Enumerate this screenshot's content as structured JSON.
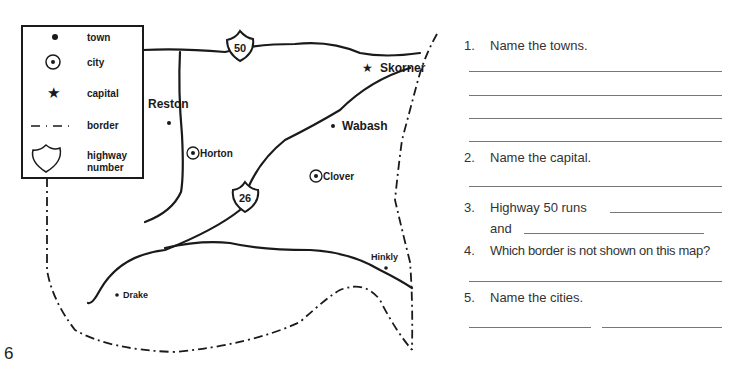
{
  "legend": {
    "items": [
      {
        "symbol": "town-dot",
        "label": "town"
      },
      {
        "symbol": "city-circle",
        "label": "city"
      },
      {
        "symbol": "capital-star",
        "label": "capital"
      },
      {
        "symbol": "border-dash-dot",
        "label": "border"
      },
      {
        "symbol": "highway-shield",
        "label": "highway",
        "label2": "number"
      }
    ]
  },
  "map": {
    "places": [
      {
        "name": "Reston",
        "type": "town"
      },
      {
        "name": "Horton",
        "type": "city"
      },
      {
        "name": "Skorner",
        "type": "capital"
      },
      {
        "name": "Wabash",
        "type": "town"
      },
      {
        "name": "Clover",
        "type": "city"
      },
      {
        "name": "Hinkly",
        "type": "town"
      },
      {
        "name": "Drake",
        "type": "town"
      }
    ],
    "highways": [
      {
        "number": "50"
      },
      {
        "number": "26"
      }
    ]
  },
  "questions": [
    {
      "num": "1.",
      "text": "Name the towns."
    },
    {
      "num": "2.",
      "text": "Name the capital."
    },
    {
      "num": "3.",
      "text": "Highway 50 runs",
      "text2": "and"
    },
    {
      "num": "4.",
      "text": "Which border is not shown on this map?"
    },
    {
      "num": "5.",
      "text": "Name the cities."
    }
  ],
  "page_number": "6"
}
